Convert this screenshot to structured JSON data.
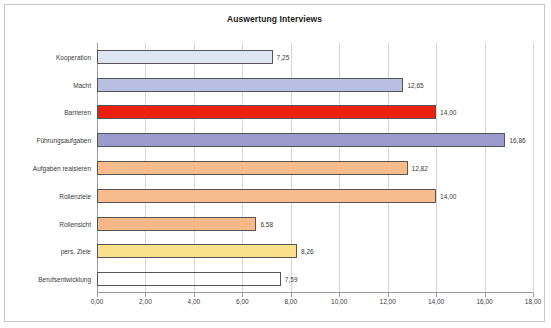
{
  "chart_data": {
    "type": "bar",
    "orientation": "horizontal",
    "title": "Auswertung Interviews",
    "xlabel": "",
    "ylabel": "",
    "xlim": [
      0,
      18
    ],
    "xtick_step": 2,
    "grid": true,
    "legend": false,
    "xticks": [
      "0,00",
      "2,00",
      "4,00",
      "6,00",
      "8,00",
      "10,00",
      "12,00",
      "14,00",
      "16,00",
      "18,00"
    ],
    "categories": [
      "Kooperation",
      "Macht",
      "Barrieren",
      "Führungsaufgaben",
      "Aufgaben realsieren",
      "Rollenziele",
      "Rollensicht",
      "pers. Ziele",
      "Berufsentwicklung"
    ],
    "values": [
      7.25,
      12.65,
      14.0,
      16.86,
      12.82,
      14.0,
      6.58,
      8.26,
      7.59
    ],
    "value_labels": [
      "7,25",
      "12,65",
      "14,00",
      "16,86",
      "12,82",
      "14,00",
      "6,58",
      "8,26",
      "7,59"
    ],
    "bar_colors": [
      "#dfe4f2",
      "#b9bfe3",
      "#e8200c",
      "#9b9bcd",
      "#f7bb8c",
      "#f7bb8c",
      "#f7b98a",
      "#fbe08a",
      "#fcc councils"
    ],
    "bar_colors_fixed": [
      "#dfe4f2",
      "#b9bfe3",
      "#e8200c",
      "#9b9bcd",
      "#f7bb8c",
      "#f7bb8c",
      "#f7b98a",
      "#fbe08a",
      "#fbc githubusercontent"
    ]
  },
  "style": {
    "bar_border": "#555555",
    "grid_color": "#d6d6d6",
    "axis_color": "#9a9a9a",
    "frame_color": "#c9c9c9",
    "text_color": "#3a3a3a"
  },
  "bars": [
    {
      "label": "Kooperation",
      "value": 7.25,
      "value_label": "7,25",
      "color": "#dfe4f2"
    },
    {
      "label": "Macht",
      "value": 12.65,
      "value_label": "12,65",
      "color": "#b9bfe3"
    },
    {
      "label": "Barrieren",
      "value": 14.0,
      "value_label": "14,00",
      "color": "#e8200c"
    },
    {
      "label": "Führungsaufgaben",
      "value": 16.86,
      "value_label": "16,86",
      "color": "#9b9bcd"
    },
    {
      "label": "Aufgaben realsieren",
      "value": 12.82,
      "value_label": "12,82",
      "color": "#f8bc8c"
    },
    {
      "label": "Rollenziele",
      "value": 14.0,
      "value_label": "14,00",
      "color": "#f8bc8c"
    },
    {
      "label": "Rollensicht",
      "value": 6.58,
      "value_label": "6,58",
      "color": "#f8b887"
    },
    {
      "label": "pers. Ziele",
      "value": 8.26,
      "value_label": "8,26",
      "color": "#fbe08c"
    },
    {
      "label": "Berufsentwicklung",
      "value": 7.59,
      "value_label": "7,59",
      "color": "#fbc githubusercontent2"
    }
  ]
}
